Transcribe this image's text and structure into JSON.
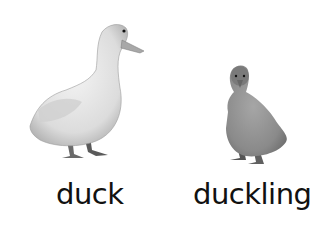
{
  "items": [
    {
      "name": "duck",
      "label": "duck"
    },
    {
      "name": "duckling",
      "label": "duckling"
    }
  ]
}
